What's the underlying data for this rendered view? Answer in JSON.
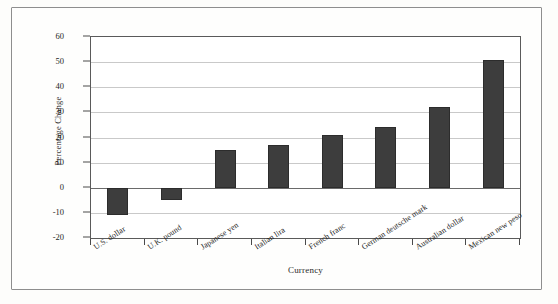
{
  "chart_data": {
    "type": "bar",
    "title": "",
    "xlabel": "Currency",
    "ylabel": "Percentage Change",
    "categories": [
      "U.S. dollar",
      "U.K. pound",
      "Japanese yen",
      "Italian lira",
      "French franc",
      "German deutsche mark",
      "Australian dollar",
      "Mexican new peso"
    ],
    "values": [
      -11,
      -5,
      15,
      17,
      21,
      24,
      32,
      51
    ],
    "ylim": [
      -20,
      60
    ],
    "ytick_labels": [
      "60",
      "50",
      "40",
      "30",
      "20",
      "10",
      "0",
      "-10",
      "-20"
    ],
    "ytick_values": [
      60,
      50,
      40,
      30,
      20,
      10,
      0,
      -10,
      -20
    ],
    "grid": true,
    "legend": "none",
    "bar_color": "#3d3d3d",
    "gridline_color": "#c9c9c9",
    "axis_color": "#5a5a5a",
    "background_color": "#ffffff"
  }
}
